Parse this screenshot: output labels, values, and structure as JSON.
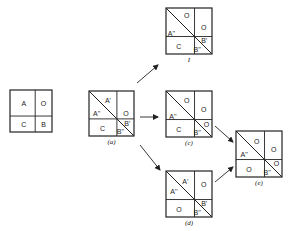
{
  "diagram": {
    "type": "partition-square-transformations",
    "panels": [
      {
        "id": "initial",
        "caption": "",
        "x": 10,
        "y": 90,
        "size": 42,
        "vsplit": 0.6,
        "hsplit": 0.62,
        "diagonal": false,
        "labels": [
          {
            "text": "A",
            "dx": 0.33,
            "dy": 0.33
          },
          {
            "text": "O",
            "dx": 0.8,
            "dy": 0.33
          },
          {
            "text": "C",
            "dx": 0.33,
            "dy": 0.83
          },
          {
            "text": "B",
            "dx": 0.8,
            "dy": 0.83
          }
        ]
      },
      {
        "id": "a",
        "caption": "(a)",
        "x": 89,
        "y": 91,
        "size": 45,
        "vsplit": 0.62,
        "hsplit": 0.62,
        "diagonal": true,
        "labels": [
          {
            "text": "A'",
            "dx": 0.42,
            "dy": 0.22
          },
          {
            "text": "A''",
            "dx": 0.17,
            "dy": 0.5
          },
          {
            "text": "O",
            "dx": 0.82,
            "dy": 0.5
          },
          {
            "text": "C",
            "dx": 0.3,
            "dy": 0.83
          },
          {
            "text": "B'",
            "dx": 0.85,
            "dy": 0.73
          },
          {
            "text": "B''",
            "dx": 0.7,
            "dy": 0.9
          }
        ]
      },
      {
        "id": "I",
        "caption": "I",
        "x": 166,
        "y": 8,
        "size": 46,
        "vsplit": 0.62,
        "hsplit": 0.62,
        "diagonal": true,
        "labels": [
          {
            "text": "O",
            "dx": 0.45,
            "dy": 0.16
          },
          {
            "text": "O",
            "dx": 0.82,
            "dy": 0.42
          },
          {
            "text": "A''",
            "dx": 0.12,
            "dy": 0.55
          },
          {
            "text": "C",
            "dx": 0.28,
            "dy": 0.83
          },
          {
            "text": "B'",
            "dx": 0.83,
            "dy": 0.7
          },
          {
            "text": "B''",
            "dx": 0.68,
            "dy": 0.9
          }
        ]
      },
      {
        "id": "c",
        "caption": "(c)",
        "x": 166,
        "y": 91,
        "size": 46,
        "vsplit": 0.62,
        "hsplit": 0.62,
        "diagonal": true,
        "labels": [
          {
            "text": "O",
            "dx": 0.45,
            "dy": 0.2
          },
          {
            "text": "O",
            "dx": 0.82,
            "dy": 0.4
          },
          {
            "text": "A''",
            "dx": 0.15,
            "dy": 0.55
          },
          {
            "text": "C",
            "dx": 0.28,
            "dy": 0.83
          },
          {
            "text": "O",
            "dx": 0.88,
            "dy": 0.73
          },
          {
            "text": "B''",
            "dx": 0.68,
            "dy": 0.9
          }
        ]
      },
      {
        "id": "d",
        "caption": "(d)",
        "x": 166,
        "y": 171,
        "size": 46,
        "vsplit": 0.62,
        "hsplit": 0.62,
        "diagonal": true,
        "labels": [
          {
            "text": "A'",
            "dx": 0.42,
            "dy": 0.22
          },
          {
            "text": "A''",
            "dx": 0.17,
            "dy": 0.45
          },
          {
            "text": "O",
            "dx": 0.82,
            "dy": 0.3
          },
          {
            "text": "O",
            "dx": 0.28,
            "dy": 0.83
          },
          {
            "text": "B'",
            "dx": 0.83,
            "dy": 0.7
          },
          {
            "text": "B''",
            "dx": 0.68,
            "dy": 0.9
          }
        ]
      },
      {
        "id": "e",
        "caption": "(e)",
        "x": 236,
        "y": 131,
        "size": 46,
        "vsplit": 0.62,
        "hsplit": 0.62,
        "diagonal": true,
        "labels": [
          {
            "text": "O",
            "dx": 0.45,
            "dy": 0.22
          },
          {
            "text": "O",
            "dx": 0.82,
            "dy": 0.4
          },
          {
            "text": "A''",
            "dx": 0.18,
            "dy": 0.52
          },
          {
            "text": "O",
            "dx": 0.28,
            "dy": 0.83
          },
          {
            "text": "O",
            "dx": 0.88,
            "dy": 0.7
          },
          {
            "text": "B''",
            "dx": 0.68,
            "dy": 0.9
          }
        ]
      }
    ],
    "arrows": [
      {
        "from": [
          137,
          83
        ],
        "to": [
          158,
          65
        ]
      },
      {
        "from": [
          140,
          117
        ],
        "to": [
          158,
          117
        ]
      },
      {
        "from": [
          140,
          145
        ],
        "to": [
          160,
          170
        ]
      },
      {
        "from": [
          215,
          126
        ],
        "to": [
          233,
          142
        ]
      },
      {
        "from": [
          215,
          182
        ],
        "to": [
          233,
          167
        ]
      }
    ]
  }
}
